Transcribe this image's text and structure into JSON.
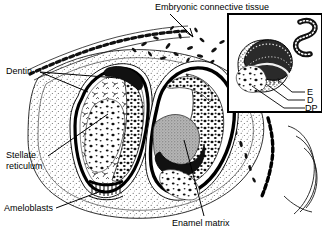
{
  "figure": {
    "background_color": "#ffffff",
    "ink_color": "#000000",
    "enamel_matrix_color": "#9a9a9a",
    "stipple_color": "#555555",
    "width": 322,
    "height": 240
  },
  "labels": {
    "embryonic_connective_tissue": "Embryonic connective tissue",
    "dentin": "Dentin",
    "stellate_reticulum_line1": "Stellate",
    "stellate_reticulum_line2": "reticulum",
    "ameloblasts": "Ameloblasts",
    "enamel_matrix": "Enamel matrix"
  },
  "inset": {
    "name": "tooth-germ-inset",
    "labels": {
      "enamel": "E",
      "dentin": "D",
      "dental_papilla": "DP"
    }
  }
}
